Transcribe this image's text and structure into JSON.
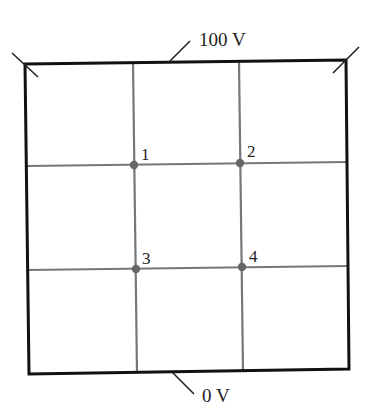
{
  "diagram": {
    "type": "potential-grid",
    "labels": {
      "top_potential": "100 V",
      "bottom_potential": "0 V"
    },
    "points": [
      {
        "id": "1",
        "label": "1"
      },
      {
        "id": "2",
        "label": "2"
      },
      {
        "id": "3",
        "label": "3"
      },
      {
        "id": "4",
        "label": "4"
      }
    ],
    "colors": {
      "boundary": "#111111",
      "grid": "#777777",
      "points": "#666666",
      "text": "#222222"
    }
  }
}
